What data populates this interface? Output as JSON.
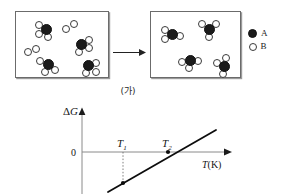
{
  "figure": {
    "stage_caption": "(가)"
  },
  "reaction": {
    "arrow_icon": "right-arrow-icon",
    "before": {
      "label": "before-reaction-box",
      "molecules": [
        {
          "type": "AB3",
          "cx": 30,
          "cy": 17,
          "b_offsets": [
            [
              -7.5,
              -4.5
            ],
            [
              -7.5,
              5.0
            ],
            [
              2.0,
              7.5
            ]
          ]
        },
        {
          "type": "AB3",
          "cx": 65,
          "cy": 32,
          "b_offsets": [
            [
              7.5,
              -4.5
            ],
            [
              8.0,
              4.0
            ],
            [
              -2.0,
              8.0
            ]
          ]
        },
        {
          "type": "AB3",
          "cx": 32,
          "cy": 52,
          "b_offsets": [
            [
              -8.0,
              -3.0
            ],
            [
              -3.5,
              8.0
            ],
            [
              6.5,
              6.0
            ]
          ]
        },
        {
          "type": "AB3",
          "cx": 72,
          "cy": 53,
          "b_offsets": [
            [
              8.0,
              -2.0
            ],
            [
              8.0,
              6.5
            ],
            [
              -2.5,
              8.0
            ]
          ]
        }
      ],
      "pairs": [
        {
          "type": "B2",
          "cx": 54,
          "cy": 14,
          "b_offsets": [
            [
              -4.5,
              2.5
            ],
            [
              4.0,
              -2.5
            ]
          ]
        },
        {
          "type": "B2",
          "cx": 16,
          "cy": 38,
          "b_offsets": [
            [
              -4.5,
              1.5
            ],
            [
              4.0,
              -1.5
            ]
          ]
        }
      ]
    },
    "after": {
      "label": "after-reaction-box",
      "molecules": [
        {
          "type": "AB3",
          "cx": 21,
          "cy": 22,
          "b_offsets": [
            [
              -7.5,
              -4.5
            ],
            [
              -7.5,
              5.0
            ],
            [
              7.5,
              1.5
            ]
          ]
        },
        {
          "type": "AB3",
          "cx": 58,
          "cy": 17,
          "b_offsets": [
            [
              -7.0,
              -5.0
            ],
            [
              6.5,
              -5.0
            ],
            [
              0.0,
              8.0
            ]
          ]
        },
        {
          "type": "AB3",
          "cx": 39,
          "cy": 48,
          "b_offsets": [
            [
              -8.0,
              1.5
            ],
            [
              -1.0,
              8.0
            ],
            [
              7.5,
              1.0
            ]
          ]
        },
        {
          "type": "AB3",
          "cx": 73,
          "cy": 54,
          "b_offsets": [
            [
              -7.5,
              -3.5
            ],
            [
              2.0,
              -8.0
            ],
            [
              -1.5,
              8.0
            ]
          ]
        }
      ],
      "pairs": []
    }
  },
  "legend": {
    "items": [
      {
        "symbol": "filled-circle",
        "label": "A"
      },
      {
        "symbol": "open-circle",
        "label": "B"
      }
    ]
  },
  "chart_data": {
    "type": "line",
    "title": "",
    "xlabel": "T(K)",
    "ylabel": "ΔG",
    "origin_label": "0",
    "grid": false,
    "legend": "none",
    "x_axis_label_parts": {
      "variable": "T",
      "unit": "(K)"
    },
    "tick_labels": [
      {
        "name": "T1",
        "variable": "T",
        "subscript": "1",
        "x": 63,
        "sign_of_delta_g": "negative"
      },
      {
        "name": "T2",
        "variable": "T",
        "subscript": "2",
        "x": 108,
        "sign_of_delta_g": "zero"
      }
    ],
    "series": [
      {
        "name": "ΔG vs T",
        "points": [
          [
            48,
            -20
          ],
          [
            150,
            15
          ]
        ],
        "slope_sign": "positive",
        "zero_crossing_at": "T2"
      }
    ],
    "markers": [
      {
        "at": "T1",
        "x": 63,
        "y": -14,
        "style": "filled-dot",
        "note": "ΔG < 0 at T1"
      },
      {
        "at": "T2",
        "x": 108,
        "y": 0,
        "style": "filled-dot",
        "note": "ΔG = 0 at T2"
      }
    ],
    "guides": [
      {
        "type": "dotted-vertical",
        "from": "x-axis",
        "to": "curve",
        "at": "T1"
      }
    ],
    "axis_arrows": {
      "x": true,
      "y": true
    },
    "xlim": [
      0,
      160
    ],
    "ylim": [
      -28,
      30
    ]
  }
}
